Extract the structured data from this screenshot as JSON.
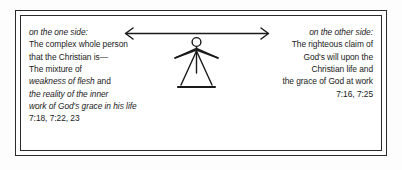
{
  "diagram": {
    "frame": {
      "style": "double-rule-box",
      "stroke_color": "#2b2b2b"
    },
    "background_color": "#fdfdfd",
    "left_block": {
      "heading": "on the one side:",
      "lines": [
        {
          "text": "The complex whole person",
          "italic": false
        },
        {
          "text": "that the Christian is—",
          "italic": false
        },
        {
          "text": "The mixture of",
          "italic": false
        }
      ],
      "mixed_line": {
        "italic_part": "weakness of flesh",
        "plain_part": " and"
      },
      "italic_lines": [
        "the reality of the inner",
        "work of God's grace in his life"
      ],
      "reference": "7:18, 7:22, 23"
    },
    "right_block": {
      "heading": "on the other side:",
      "lines": [
        "The righteous claim of",
        "God's will upon the",
        "Christian life and",
        "the grace of God at work"
      ],
      "reference": "7:16, 7:25"
    },
    "arrow": {
      "name": "double-headed-horizontal-arrow",
      "direction": "bidirectional",
      "stroke_color": "#1a1a1a"
    },
    "figure": {
      "name": "stick-figure-person",
      "parts": [
        "head-circle",
        "arms",
        "legs",
        "ground-line"
      ],
      "stroke_color": "#1a1a1a"
    }
  }
}
